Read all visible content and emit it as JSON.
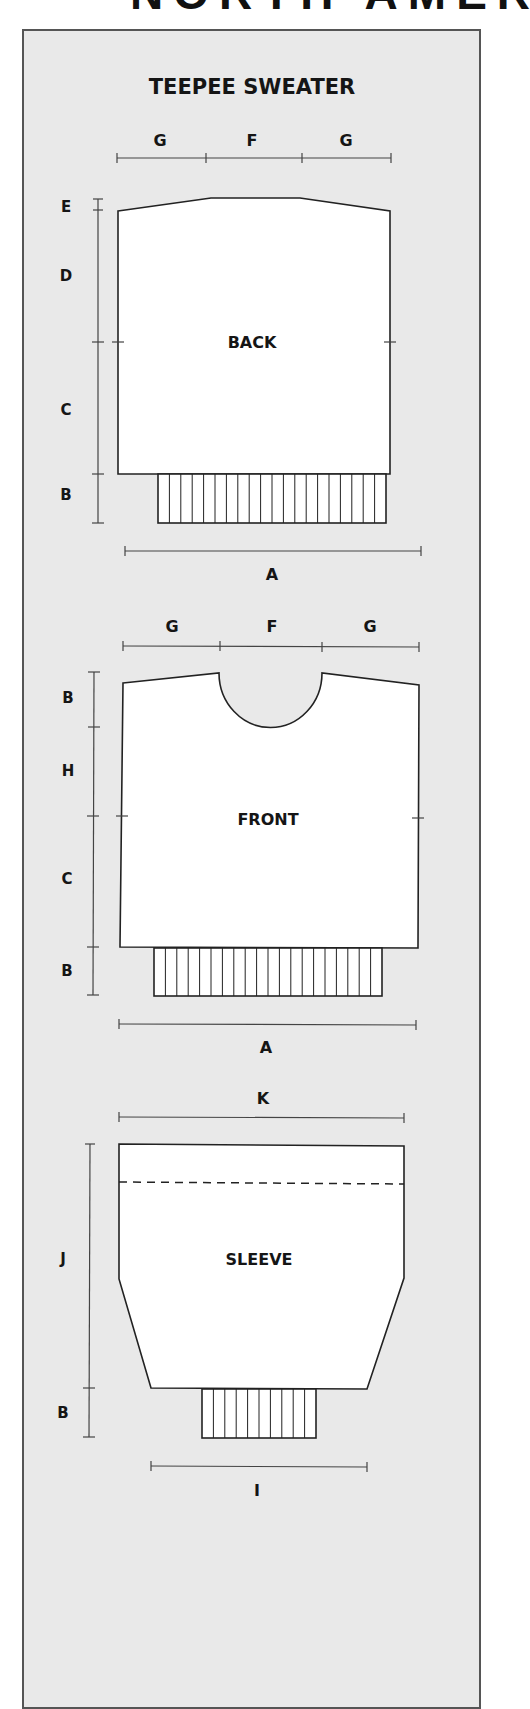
{
  "page": {
    "clipped_heading": "NORTH AMERI",
    "title": "TEEPEE SWEATER",
    "colors": {
      "panel_bg": "#e9e9e9",
      "piece_fill": "#ffffff",
      "line": "#222222"
    }
  },
  "back": {
    "label": "BACK",
    "top_dims": [
      "G",
      "F",
      "G"
    ],
    "side_dims": [
      "E",
      "D",
      "C",
      "B"
    ],
    "bottom_dim": "A",
    "rib_segments": 20
  },
  "front": {
    "label": "FRONT",
    "top_dims": [
      "G",
      "F",
      "G"
    ],
    "side_dims": [
      "B",
      "H",
      "C",
      "B"
    ],
    "bottom_dim": "A",
    "rib_segments": 20
  },
  "sleeve": {
    "label": "SLEEVE",
    "top_dim": "K",
    "side_dims": [
      "J",
      "B"
    ],
    "bottom_dim": "I",
    "rib_segments": 10
  }
}
